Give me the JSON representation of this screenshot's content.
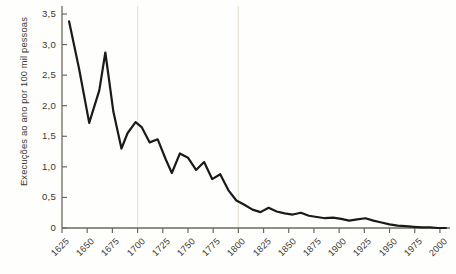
{
  "chart_data": {
    "type": "line",
    "title": "",
    "subtitle": "",
    "xlabel": "",
    "ylabel": "Execuções ao ano por 100 mil pessoas",
    "xlim": [
      1625,
      2010
    ],
    "ylim": [
      0,
      3.5
    ],
    "grid": "vertical-only",
    "legend": "none",
    "axis_color": "#6b6a60",
    "line_color": "#1a1a18",
    "gridline_color": "#e8e3d2",
    "background_color": "#fefefc",
    "y_ticks": [
      0,
      0.5,
      1.0,
      1.5,
      2.0,
      2.5,
      3.0,
      3.5
    ],
    "y_tick_labels": [
      "0",
      "0,5",
      "1,0",
      "1,5",
      "2,0",
      "2,5",
      "3,0",
      "3,5"
    ],
    "x_ticks": [
      1625,
      1650,
      1675,
      1700,
      1725,
      1750,
      1775,
      1800,
      1825,
      1850,
      1875,
      1900,
      1925,
      1950,
      1975,
      2000
    ],
    "x_tick_labels": [
      "1625",
      "1650",
      "1675",
      "1700",
      "1725",
      "1750",
      "1775",
      "1800",
      "1825",
      "1850",
      "1875",
      "1900",
      "1925",
      "1950",
      "1975",
      "2000"
    ],
    "vertical_gridlines_at": [
      1700,
      1800
    ],
    "series": [
      {
        "name": "Execuções ao ano por 100 mil pessoas",
        "x": [
          1632,
          1642,
          1652,
          1662,
          1668,
          1676,
          1684,
          1690,
          1698,
          1704,
          1712,
          1720,
          1728,
          1734,
          1742,
          1750,
          1758,
          1766,
          1774,
          1782,
          1790,
          1798,
          1806,
          1814,
          1822,
          1830,
          1838,
          1846,
          1854,
          1862,
          1870,
          1878,
          1886,
          1894,
          1902,
          1910,
          1918,
          1926,
          1934,
          1942,
          1950,
          1958,
          1966,
          1974,
          1982,
          1990,
          1998,
          2006
        ],
        "y": [
          3.38,
          2.6,
          1.72,
          2.25,
          2.87,
          1.9,
          1.3,
          1.55,
          1.73,
          1.65,
          1.4,
          1.45,
          1.12,
          0.9,
          1.22,
          1.15,
          0.95,
          1.08,
          0.8,
          0.88,
          0.62,
          0.45,
          0.38,
          0.3,
          0.26,
          0.33,
          0.27,
          0.24,
          0.22,
          0.25,
          0.2,
          0.18,
          0.16,
          0.17,
          0.15,
          0.12,
          0.14,
          0.16,
          0.12,
          0.09,
          0.06,
          0.04,
          0.03,
          0.02,
          0.01,
          0.01,
          0.0,
          0.0
        ]
      }
    ]
  }
}
